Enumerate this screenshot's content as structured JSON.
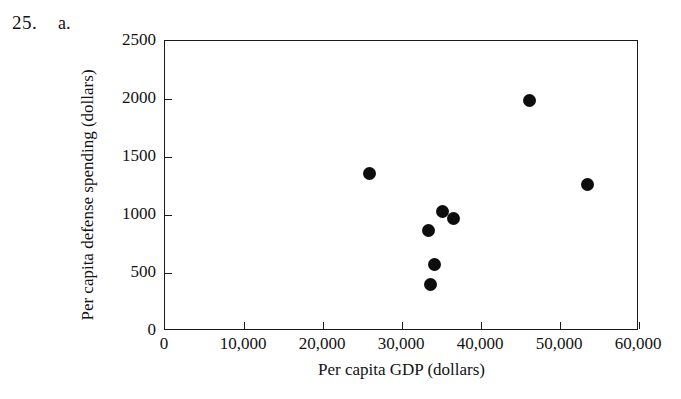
{
  "problem": {
    "number": "25.",
    "part": "a."
  },
  "chart_data": {
    "type": "scatter",
    "title": "",
    "xlabel": "Per capita GDP (dollars)",
    "ylabel": "Per capita defense spending (dollars)",
    "xlim": [
      0,
      60000
    ],
    "ylim": [
      0,
      2500
    ],
    "grid": false,
    "legend": null,
    "xticks": [
      0,
      10000,
      20000,
      30000,
      40000,
      50000,
      60000
    ],
    "yticks": [
      0,
      500,
      1000,
      1500,
      2000,
      2500
    ],
    "xticklabels": [
      "0",
      "10,000",
      "20,000",
      "30,000",
      "40,000",
      "50,000",
      "60,000"
    ],
    "yticklabels": [
      "0",
      "500",
      "1000",
      "1500",
      "2000",
      "2500"
    ],
    "marker": "filled-circle",
    "marker_color": "#0d0d0d",
    "points": [
      {
        "x": 25900,
        "y": 1360
      },
      {
        "x": 33300,
        "y": 870
      },
      {
        "x": 33600,
        "y": 400
      },
      {
        "x": 34100,
        "y": 570
      },
      {
        "x": 35100,
        "y": 1030
      },
      {
        "x": 36500,
        "y": 970
      },
      {
        "x": 46100,
        "y": 1990
      },
      {
        "x": 53500,
        "y": 1260
      }
    ]
  }
}
